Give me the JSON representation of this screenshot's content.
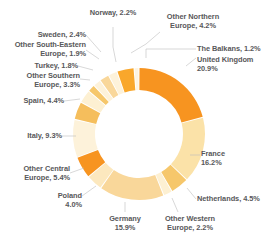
{
  "chart_data": {
    "type": "pie",
    "variant": "donut",
    "title": "",
    "subtitle": "",
    "xlabel": "",
    "ylabel": "",
    "legend_position": "none",
    "grid": false,
    "units": "percent",
    "start_angle_deg": 0,
    "direction": "clockwise",
    "total": 99.8,
    "categories": [
      "United Kingdom",
      "France",
      "Netherlands",
      "Other Western Europe",
      "Germany",
      "Poland",
      "Other Central Europe",
      "Italy",
      "Spain",
      "Other Southern Europe",
      "Turkey",
      "Other South-Eastern Europe",
      "Sweden",
      "Norway",
      "Other Northern Europe",
      "The Balkans"
    ],
    "values": [
      20.9,
      16.2,
      4.5,
      2.2,
      15.9,
      4.0,
      5.4,
      9.3,
      4.4,
      3.3,
      1.8,
      1.9,
      2.4,
      2.2,
      4.2,
      1.2
    ],
    "colors": [
      "#F79420",
      "#FBE2A8",
      "#F6C76B",
      "#FDF0D2",
      "#F9D79A",
      "#FCE8BE",
      "#F79420",
      "#FDF2DA",
      "#F5BE5C",
      "#FDF0D2",
      "#F6C76B",
      "#FDF2DA",
      "#F9D79A",
      "#FDF2DA",
      "#F9A72B",
      "#FDF4E2"
    ],
    "slices": [
      {
        "label": "United Kingdom",
        "value": 20.9,
        "text": "United Kingdom\n20.9%",
        "color": "#F79420"
      },
      {
        "label": "France",
        "value": 16.2,
        "text": "France\n16.2%",
        "color": "#FBE2A8"
      },
      {
        "label": "Netherlands",
        "value": 4.5,
        "text": "Netherlands, 4.5%",
        "color": "#F6C76B"
      },
      {
        "label": "Other Western Europe",
        "value": 2.2,
        "text": "Other Western\nEurope, 2.2%",
        "color": "#FDF0D2"
      },
      {
        "label": "Germany",
        "value": 15.9,
        "text": "Germany\n15.9%",
        "color": "#F9D79A"
      },
      {
        "label": "Poland",
        "value": 4.0,
        "text": "Poland\n4.0%",
        "color": "#FCE8BE"
      },
      {
        "label": "Other Central Europe",
        "value": 5.4,
        "text": "Other Central\nEurope, 5.4%",
        "color": "#F79420"
      },
      {
        "label": "Italy",
        "value": 9.3,
        "text": "Italy, 9.3%",
        "color": "#FDF2DA"
      },
      {
        "label": "Spain",
        "value": 4.4,
        "text": "Spain, 4.4%",
        "color": "#F5BE5C"
      },
      {
        "label": "Other Southern Europe",
        "value": 3.3,
        "text": "Other Southern\nEurope, 3.3%",
        "color": "#FDF0D2"
      },
      {
        "label": "Turkey",
        "value": 1.8,
        "text": "Turkey, 1.8%",
        "color": "#F6C76B"
      },
      {
        "label": "Other South-Eastern Europe",
        "value": 1.9,
        "text": "Other South-Eastern\nEurope, 1.9%",
        "color": "#FDF2DA"
      },
      {
        "label": "Sweden",
        "value": 2.4,
        "text": "Sweden, 2.4%",
        "color": "#F9D79A"
      },
      {
        "label": "Norway",
        "value": 2.2,
        "text": "Norway, 2.2%",
        "color": "#FDF2DA"
      },
      {
        "label": "Other Northern Europe",
        "value": 4.2,
        "text": "Other Northern\nEurope, 4.2%",
        "color": "#F9A72B"
      },
      {
        "label": "The Balkans",
        "value": 1.2,
        "text": "The Balkans, 1.2%",
        "color": "#FDF4E2"
      }
    ]
  },
  "labels": {
    "united_kingdom": "United Kingdom\n20.9%",
    "france": "France\n16.2%",
    "netherlands": "Netherlands, 4.5%",
    "other_western_europe": "Other Western\nEurope, 2.2%",
    "germany": "Germany\n15.9%",
    "poland": "Poland\n4.0%",
    "other_central_europe": "Other Central\nEurope, 5.4%",
    "italy": "Italy, 9.3%",
    "spain": "Spain, 4.4%",
    "other_southern_europe": "Other Southern\nEurope, 3.3%",
    "turkey": "Turkey, 1.8%",
    "other_south_eastern_europe": "Other South-Eastern\nEurope, 1.9%",
    "sweden": "Sweden, 2.4%",
    "norway": "Norway, 2.2%",
    "other_northern_europe": "Other Northern\nEurope, 4.2%",
    "the_balkans": "The Balkans, 1.2%"
  },
  "style": {
    "background": "#FFFFFF",
    "label_color": "#58585A",
    "leader_line_color": "#BDBDBD",
    "slice_gap_color": "#FFFFFF"
  }
}
